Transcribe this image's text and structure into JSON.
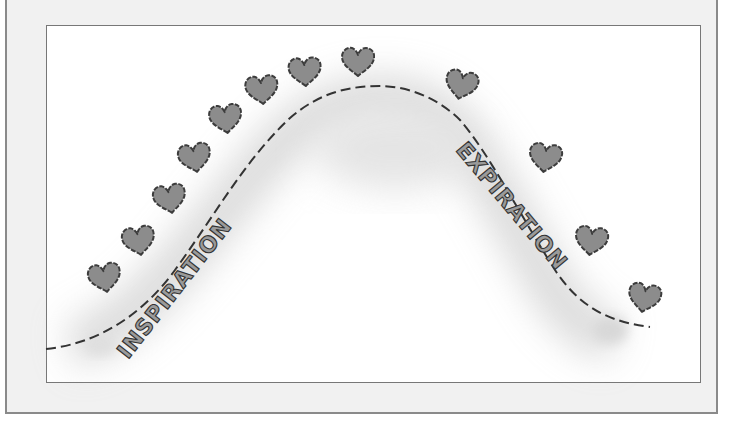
{
  "diagram": {
    "type": "breathing-wave-illustration",
    "labels": {
      "inspiration": "INSPIRATION",
      "expiration": "EXPIRATION"
    },
    "colors": {
      "frame_background": "#f1f1f1",
      "frame_border": "#8a8a8a",
      "canvas_background": "#ffffff",
      "heart_fill": "#8c8c8c",
      "heart_outline": "#444444",
      "curve": "#333333",
      "shadow": "#c8c8c8"
    },
    "hearts": [
      {
        "x": 105,
        "y": 278
      },
      {
        "x": 139,
        "y": 240
      },
      {
        "x": 171,
        "y": 198
      },
      {
        "x": 196,
        "y": 159
      },
      {
        "x": 226,
        "y": 119
      },
      {
        "x": 261,
        "y": 91
      },
      {
        "x": 305,
        "y": 72
      },
      {
        "x": 358,
        "y": 62
      },
      {
        "x": 461,
        "y": 83
      },
      {
        "x": 545,
        "y": 158
      },
      {
        "x": 589,
        "y": 240
      },
      {
        "x": 644,
        "y": 296
      }
    ]
  }
}
